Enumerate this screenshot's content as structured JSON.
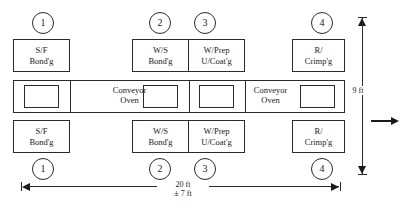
{
  "diagram": {
    "units": "ft",
    "line_color": "#2b2b2b"
  },
  "stations": [
    {
      "tag": "1",
      "line1": "S/F",
      "line2": "Bond'g"
    },
    {
      "tag": "2",
      "line1": "W/S",
      "line2": "Bond'g"
    },
    {
      "tag": "3",
      "line1": "W/Prep",
      "line2": "U/Coat'g"
    },
    {
      "tag": "4",
      "line1": "R/",
      "line2": "Crimp'g"
    }
  ],
  "ovens": [
    {
      "line1": "Conveyor",
      "line2": "Oven"
    },
    {
      "line1": "Conveyor",
      "line2": "Oven"
    }
  ],
  "dimensions": {
    "height": {
      "label": "9 ft"
    },
    "width": {
      "label_main": "20 ft",
      "label_tol": "± 7 ft"
    }
  },
  "flow": {
    "direction_icon": "arrow-right-icon"
  }
}
